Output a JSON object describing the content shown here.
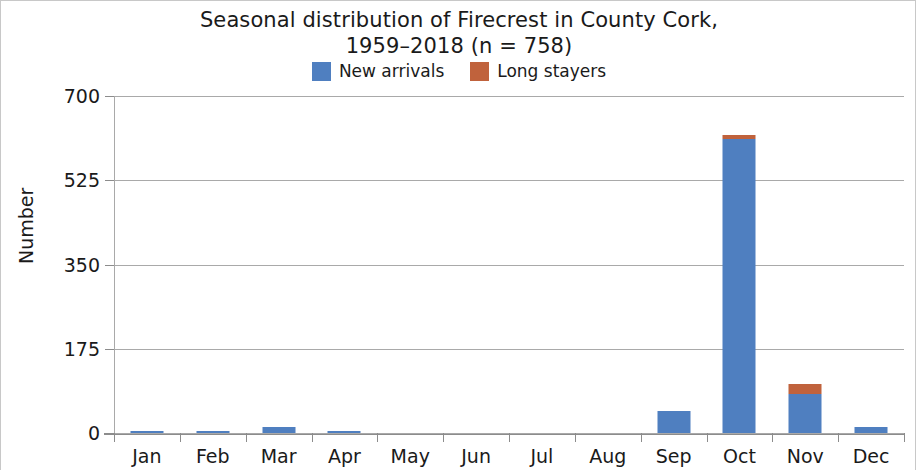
{
  "chart_data": {
    "type": "bar",
    "title": "Seasonal distribution of Firecrest in County Cork, 1959–2018 (n = 758)",
    "title_line1": "Seasonal distribution of Firecrest in County Cork,",
    "title_line2": "1959–2018 (n = 758)",
    "xlabel": "",
    "ylabel": "Number",
    "ylim": [
      0,
      700
    ],
    "yticks": [
      0,
      175,
      350,
      525,
      700
    ],
    "ytick_labels": [
      "0",
      "175",
      "350",
      "525",
      "700"
    ],
    "grid": true,
    "stacked": true,
    "legend_position": "top-center",
    "categories": [
      "Jan",
      "Feb",
      "Mar",
      "Apr",
      "May",
      "Jun",
      "Jul",
      "Aug",
      "Sep",
      "Oct",
      "Nov",
      "Dec"
    ],
    "series": [
      {
        "name": "New arrivals",
        "color": "#4f7fc0",
        "values": [
          4,
          4,
          13,
          4,
          0,
          0,
          0,
          0,
          46,
          610,
          81,
          12
        ]
      },
      {
        "name": "Long stayers",
        "color": "#c0623c",
        "values": [
          0,
          0,
          0,
          0,
          0,
          0,
          0,
          0,
          0,
          10,
          21,
          0
        ]
      }
    ]
  },
  "legend": {
    "items": [
      {
        "label": "New arrivals",
        "color": "#4f7fc0"
      },
      {
        "label": "Long stayers",
        "color": "#c0623c"
      }
    ]
  }
}
